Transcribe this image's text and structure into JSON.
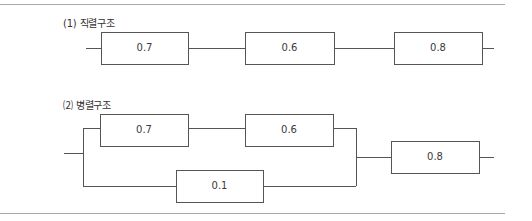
{
  "colors": {
    "line": "#555555",
    "rule": "#a8a8a8",
    "text": "#333333"
  },
  "series": {
    "label": "(1) 직렬구조",
    "blocks": [
      {
        "value": "0.7",
        "x": 101,
        "y": 32,
        "w": 87,
        "h": 32
      },
      {
        "value": "0.6",
        "x": 245,
        "y": 32,
        "w": 89,
        "h": 32
      },
      {
        "value": "0.8",
        "x": 394,
        "y": 32,
        "w": 88,
        "h": 32
      }
    ]
  },
  "parallel": {
    "label": "⑵ 병렬구조",
    "blocks": [
      {
        "value": "0.7",
        "x": 100,
        "y": 114,
        "w": 88,
        "h": 32
      },
      {
        "value": "0.6",
        "x": 245,
        "y": 114,
        "w": 88,
        "h": 32
      },
      {
        "value": "0.1",
        "x": 176,
        "y": 170,
        "w": 87,
        "h": 32
      },
      {
        "value": "0.8",
        "x": 391,
        "y": 141,
        "w": 88,
        "h": 32
      }
    ]
  }
}
